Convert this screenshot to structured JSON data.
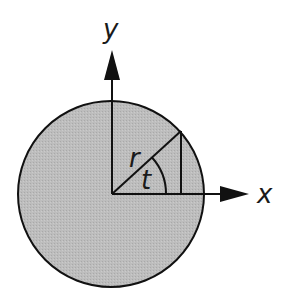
{
  "diagram": {
    "title": "",
    "labels": {
      "y_axis": "y",
      "x_axis": "x",
      "radius": "r",
      "angle": "t"
    },
    "colors": {
      "disk_fill": "#bdbdbd",
      "stroke": "#111111",
      "background": "#ffffff"
    }
  }
}
